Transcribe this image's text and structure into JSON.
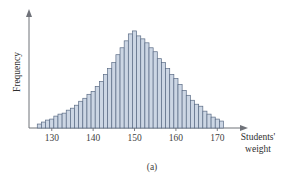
{
  "figure": {
    "caption": "(a)",
    "background_color": "#ffffff"
  },
  "chart_data": {
    "type": "bar",
    "title": "",
    "subtitle": "",
    "xlabel_line1": "Students'",
    "xlabel_line2": "weight",
    "ylabel": "Frequency",
    "xlabel": "Students' weight",
    "grid": false,
    "legend": null,
    "legend_position": "none",
    "xlim": [
      124.5,
      175
    ],
    "ylim": [
      0,
      105
    ],
    "xticks": [
      130,
      140,
      150,
      160,
      170
    ],
    "xtick_labels": [
      "130",
      "140",
      "150",
      "160",
      "170"
    ],
    "yticks": [],
    "ytick_labels": [],
    "bar_fill_color": "#ccd6e4",
    "bar_edge_color": "#5a6b85",
    "axis_color": "#6f7279",
    "annotations": [],
    "bin_width": 1,
    "categories": [
      127,
      128,
      129,
      130,
      131,
      132,
      133,
      134,
      135,
      136,
      137,
      138,
      139,
      140,
      141,
      142,
      143,
      144,
      145,
      146,
      147,
      148,
      149,
      150,
      151,
      152,
      153,
      154,
      155,
      156,
      157,
      158,
      159,
      160,
      161,
      162,
      163,
      164,
      165,
      166,
      167,
      168,
      169,
      170,
      171
    ],
    "values": [
      4,
      6,
      8,
      9,
      12,
      14,
      15,
      18,
      20,
      23,
      27,
      30,
      34,
      37,
      42,
      47,
      54,
      60,
      66,
      74,
      81,
      88,
      95,
      98,
      93,
      90,
      86,
      81,
      77,
      70,
      66,
      60,
      54,
      50,
      44,
      38,
      33,
      28,
      24,
      22,
      17,
      14,
      11,
      9,
      7
    ]
  }
}
